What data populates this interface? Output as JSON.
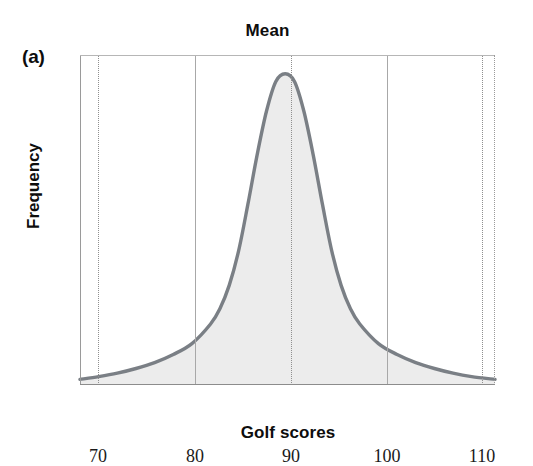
{
  "figure": {
    "panel_label": "(a)",
    "title": "Mean"
  },
  "axes": {
    "xlabel": "Golf scores",
    "ylabel": "Frequency",
    "xticks": [
      "70",
      "80",
      "90",
      "100",
      "110"
    ],
    "yticks": []
  },
  "colors": {
    "curve": "#7a7f85",
    "fill": "#ececec",
    "grid_dotted": "#8f8f8f",
    "grid_solid": "#a8a8a8",
    "frame": "#8c8c8c",
    "text": "#0d0d0d",
    "background": "#ffffff"
  },
  "chart_data": {
    "type": "line",
    "title": "Mean",
    "xlabel": "Golf scores",
    "ylabel": "Frequency",
    "xlim": [
      68,
      112.5
    ],
    "ylim": [
      0,
      1.06
    ],
    "xticks": [
      70,
      80,
      90,
      100,
      110
    ],
    "yticks": [],
    "grid": "vertical-only",
    "legend": "none",
    "annotations": [
      {
        "text": "Mean",
        "x": 90,
        "role": "mean-marker-label",
        "position": "above-plot"
      },
      {
        "text": "(a)",
        "role": "panel-letter",
        "position": "top-left-outside"
      }
    ],
    "series": [
      {
        "name": "Frequency of golf scores",
        "mean": 90,
        "x": [
          68,
          70,
          72,
          74,
          76,
          78,
          80,
          82,
          83,
          84,
          85,
          86,
          87,
          88,
          89,
          90,
          91,
          92,
          93,
          94,
          95,
          96,
          97,
          98,
          100,
          102,
          104,
          106,
          108,
          110,
          112.5
        ],
        "y": [
          0.018,
          0.027,
          0.038,
          0.053,
          0.072,
          0.098,
          0.133,
          0.196,
          0.245,
          0.32,
          0.43,
          0.58,
          0.74,
          0.88,
          0.975,
          1.0,
          0.975,
          0.88,
          0.74,
          0.58,
          0.43,
          0.32,
          0.245,
          0.196,
          0.133,
          0.098,
          0.072,
          0.053,
          0.038,
          0.027,
          0.018
        ]
      }
    ]
  }
}
